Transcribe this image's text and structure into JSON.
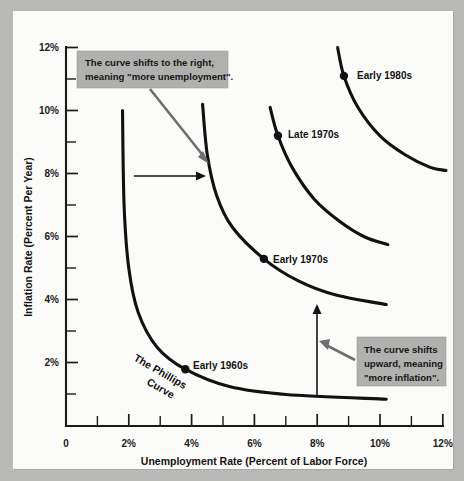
{
  "chart_data": {
    "type": "line",
    "title": "",
    "xlabel": "Unemployment Rate (Percent of Labor Force)",
    "ylabel": "Inflation Rate (Percent Per Year)",
    "xlim": [
      0,
      12
    ],
    "ylim": [
      0,
      12
    ],
    "grid": false,
    "legend_position": "none",
    "x_ticks": [
      "0",
      "2%",
      "4%",
      "6%",
      "8%",
      "10%",
      "12%"
    ],
    "x_tick_values": [
      0,
      2,
      4,
      6,
      8,
      10,
      12
    ],
    "x_minor_ticks": [
      1,
      3,
      5,
      7,
      9,
      11
    ],
    "y_ticks": [
      "2%",
      "4%",
      "6%",
      "8%",
      "10%",
      "12%"
    ],
    "y_tick_values": [
      2,
      4,
      6,
      8,
      10,
      12
    ],
    "y_minor_ticks": [
      1,
      3,
      5,
      7,
      9,
      11
    ],
    "y_origin_label": "0",
    "series": [
      {
        "name": "The Phillips Curve",
        "label_point": "Early 1960s",
        "point": {
          "x": 3.8,
          "y": 1.8
        },
        "points": [
          {
            "x": 1.8,
            "y": 10.0
          },
          {
            "x": 1.85,
            "y": 7.0
          },
          {
            "x": 2.0,
            "y": 5.0
          },
          {
            "x": 2.3,
            "y": 3.6
          },
          {
            "x": 2.9,
            "y": 2.5
          },
          {
            "x": 3.8,
            "y": 1.8
          },
          {
            "x": 5.2,
            "y": 1.25
          },
          {
            "x": 7.0,
            "y": 1.0
          },
          {
            "x": 10.2,
            "y": 0.85
          }
        ]
      },
      {
        "name": "Curve 2",
        "label_point": "Early 1970s",
        "point": {
          "x": 6.3,
          "y": 5.3
        },
        "points": [
          {
            "x": 4.35,
            "y": 10.2
          },
          {
            "x": 4.5,
            "y": 8.6
          },
          {
            "x": 4.8,
            "y": 7.3
          },
          {
            "x": 5.3,
            "y": 6.3
          },
          {
            "x": 6.3,
            "y": 5.3
          },
          {
            "x": 7.4,
            "y": 4.6
          },
          {
            "x": 8.6,
            "y": 4.15
          },
          {
            "x": 10.2,
            "y": 3.85
          }
        ]
      },
      {
        "name": "Curve 3",
        "label_point": "Late 1970s",
        "point": {
          "x": 6.75,
          "y": 9.2
        },
        "points": [
          {
            "x": 6.5,
            "y": 10.1
          },
          {
            "x": 6.75,
            "y": 9.2
          },
          {
            "x": 7.2,
            "y": 8.2
          },
          {
            "x": 7.9,
            "y": 7.2
          },
          {
            "x": 8.7,
            "y": 6.5
          },
          {
            "x": 9.5,
            "y": 6.0
          },
          {
            "x": 10.25,
            "y": 5.75
          }
        ]
      },
      {
        "name": "Curve 4",
        "label_point": "Early 1980s",
        "point": {
          "x": 8.85,
          "y": 11.1
        },
        "points": [
          {
            "x": 8.65,
            "y": 12.0
          },
          {
            "x": 8.85,
            "y": 11.1
          },
          {
            "x": 9.3,
            "y": 10.1
          },
          {
            "x": 10.0,
            "y": 9.2
          },
          {
            "x": 10.8,
            "y": 8.6
          },
          {
            "x": 11.6,
            "y": 8.2
          },
          {
            "x": 12.1,
            "y": 8.1
          }
        ]
      }
    ],
    "annotations": [
      {
        "id": "shift-right",
        "lines": [
          "The curve shifts to the right,",
          "meaning \"more unemployment\"."
        ]
      },
      {
        "id": "shift-upward",
        "lines": [
          "The curve shifts",
          "upward, meaning",
          "\"more inflation\"."
        ]
      }
    ],
    "colors": {
      "curve": "#111111",
      "axis": "#1a1a1a",
      "callout_fill": "#b0b0ae",
      "gray_arrow": "#6e6e6e",
      "page": "#fbfbf9",
      "backdrop": "#b9b9b7"
    }
  }
}
